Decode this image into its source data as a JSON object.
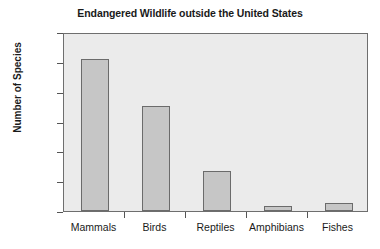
{
  "chart_data": {
    "type": "bar",
    "title": "Endangered Wildlife outside the United States",
    "xlabel": "",
    "ylabel": "Number of Species",
    "categories": [
      "Mammals",
      "Birds",
      "Reptiles",
      "Amphibians",
      "Fishes"
    ],
    "values": [
      255,
      176,
      67,
      9,
      13
    ],
    "ylim": [
      0,
      300
    ],
    "yticks": [
      0,
      50,
      100,
      150,
      200,
      250,
      300
    ],
    "ytick_labels": [
      "0",
      "50",
      "100",
      "150",
      "200",
      "250",
      "300"
    ],
    "grid": false,
    "legend": null,
    "colors": {
      "bar_fill": "#c6c6c6",
      "bar_edge": "#6b6b6b",
      "plot_background": "#ebebeb",
      "figure_background": "#ffffff",
      "axis": "#6e6e6e",
      "text": "#1a1a1a"
    }
  }
}
